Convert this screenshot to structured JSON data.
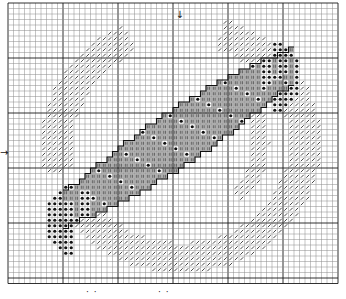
{
  "pattern": {
    "title": "Cross-stitch chart: tapered fish / streamer with crescent swirl",
    "grid": {
      "origin_x": 8,
      "origin_y": 3,
      "cell": 5.5,
      "cols": 60,
      "rows": 51,
      "major_every": 10,
      "minor_color": "#8a8a8a",
      "major_color": "#1a1a1a"
    },
    "colors": {
      "background": "#ffffff",
      "slash_symbol": "#333333",
      "body_fill": "#b8b8b8",
      "body_symbol": "#3a3a3a",
      "dot_symbol": "#111111",
      "outline": "#111111"
    },
    "symbols": {
      "slash": "diagonal-slash",
      "body": "double-bar",
      "dot": "filled-dot"
    },
    "center_markers": {
      "top": {
        "symbol": "↓",
        "col": 31
      },
      "left": {
        "symbol": "→",
        "row": 27
      }
    },
    "caption": {
      "left_mark": "·  ·",
      "right_mark": "· ·"
    }
  },
  "chart_data": {
    "type": "table",
    "legend": [
      {
        "symbol": "slash",
        "meaning": "light thread"
      },
      {
        "symbol": "double-bar",
        "meaning": "medium grey body"
      },
      {
        "symbol": "dot",
        "meaning": "dark fin thread"
      }
    ]
  }
}
